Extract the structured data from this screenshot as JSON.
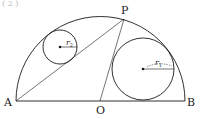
{
  "header": {
    "cut_text": "( 2 )"
  },
  "figure": {
    "points": {
      "A": {
        "label": "A",
        "x": 16,
        "y": 101
      },
      "B": {
        "label": "B",
        "x": 185,
        "y": 101
      },
      "O": {
        "label": "O",
        "x": 100,
        "y": 101
      },
      "P": {
        "label": "P",
        "x": 124,
        "y": 19
      }
    },
    "semicircle": {
      "cx": 100,
      "cy": 101,
      "r": 84.5
    },
    "circle_small": {
      "cx": 60,
      "cy": 47,
      "r": 17,
      "label": "r",
      "sub": "2"
    },
    "circle_large": {
      "cx": 143,
      "cy": 69,
      "r": 31,
      "label": "r",
      "sub": "1"
    },
    "stroke_color": "#1a1a1a"
  }
}
